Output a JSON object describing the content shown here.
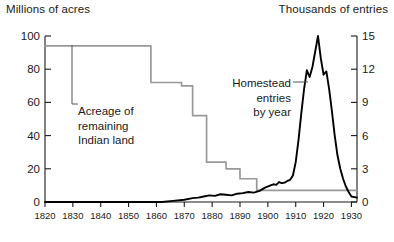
{
  "chart_data": {
    "type": "line",
    "title": "",
    "xlabel": "",
    "x_ticks": [
      1820,
      1830,
      1840,
      1850,
      1860,
      1870,
      1880,
      1890,
      1900,
      1910,
      1920,
      1930
    ],
    "xlim": [
      1820,
      1932
    ],
    "left_axis": {
      "label": "Millions of acres",
      "ticks": [
        0,
        20,
        40,
        60,
        80,
        100
      ],
      "ylim": [
        0,
        100
      ],
      "color": "#999999"
    },
    "right_axis": {
      "label": "Thousands of entries",
      "ticks": [
        0,
        3,
        6,
        9,
        12,
        15
      ],
      "ylim": [
        0,
        15
      ],
      "color": "#000000"
    },
    "grid": false,
    "legend_position": "inline-annotations",
    "series": [
      {
        "name": "Acreage of remaining Indian land",
        "axis": "left",
        "units": "millions of acres",
        "style": "step",
        "color": "#999999",
        "annotation": "Acreage of\nremaining\nIndian land",
        "points": [
          [
            1820,
            94
          ],
          [
            1850,
            94
          ],
          [
            1856,
            94
          ],
          [
            1858,
            72
          ],
          [
            1868,
            72
          ],
          [
            1869,
            70
          ],
          [
            1872,
            70
          ],
          [
            1873,
            52
          ],
          [
            1877,
            52
          ],
          [
            1878,
            24
          ],
          [
            1884,
            24
          ],
          [
            1885,
            20
          ],
          [
            1889,
            20
          ],
          [
            1890,
            14
          ],
          [
            1895,
            14
          ],
          [
            1896,
            7
          ],
          [
            1932,
            7
          ]
        ]
      },
      {
        "name": "Homestead entries by year",
        "axis": "right",
        "units": "thousands of entries",
        "style": "line",
        "color": "#000000",
        "annotation": "Homestead\nentries\nby year",
        "points": [
          [
            1820,
            0
          ],
          [
            1862,
            0
          ],
          [
            1866,
            0.1
          ],
          [
            1870,
            0.2
          ],
          [
            1873,
            0.35
          ],
          [
            1875,
            0.4
          ],
          [
            1877,
            0.5
          ],
          [
            1879,
            0.6
          ],
          [
            1881,
            0.55
          ],
          [
            1883,
            0.7
          ],
          [
            1885,
            0.65
          ],
          [
            1887,
            0.6
          ],
          [
            1889,
            0.75
          ],
          [
            1891,
            0.8
          ],
          [
            1893,
            0.9
          ],
          [
            1895,
            0.85
          ],
          [
            1897,
            1.0
          ],
          [
            1899,
            1.3
          ],
          [
            1901,
            1.5
          ],
          [
            1902,
            1.6
          ],
          [
            1903,
            1.55
          ],
          [
            1904,
            1.8
          ],
          [
            1905,
            1.7
          ],
          [
            1906,
            1.75
          ],
          [
            1907,
            1.9
          ],
          [
            1908,
            2.0
          ],
          [
            1909,
            2.4
          ],
          [
            1910,
            3.6
          ],
          [
            1911,
            5.6
          ],
          [
            1912,
            8.0
          ],
          [
            1913,
            10.2
          ],
          [
            1914,
            11.9
          ],
          [
            1915,
            11.3
          ],
          [
            1916,
            12.2
          ],
          [
            1917,
            13.6
          ],
          [
            1918,
            15.0
          ],
          [
            1919,
            13.0
          ],
          [
            1920,
            11.5
          ],
          [
            1921,
            11.8
          ],
          [
            1922,
            10.2
          ],
          [
            1923,
            8.2
          ],
          [
            1924,
            6.0
          ],
          [
            1925,
            4.2
          ],
          [
            1926,
            3.0
          ],
          [
            1927,
            2.1
          ],
          [
            1928,
            1.4
          ],
          [
            1929,
            0.9
          ],
          [
            1930,
            0.5
          ],
          [
            1932,
            0.4
          ]
        ]
      }
    ]
  },
  "annotations": {
    "indian_land": {
      "line1": "Acreage of",
      "line2": "remaining",
      "line3": "Indian land"
    },
    "homestead": {
      "line1": "Homestead",
      "line2": "entries",
      "line3": "by year"
    }
  }
}
